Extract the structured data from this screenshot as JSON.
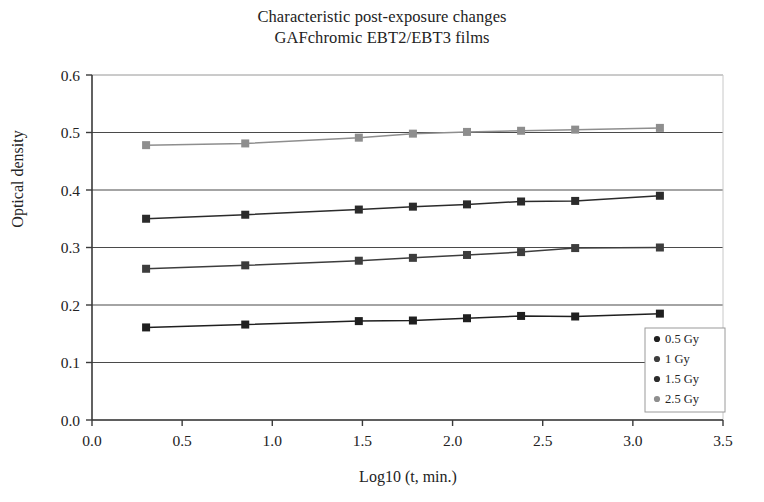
{
  "chart_data": {
    "type": "line",
    "title": "Characteristic post-exposure changes GAFchromic EBT2/EBT3 films",
    "title_lines": [
      "Characteristic post-exposure changes",
      "GAFchromic EBT2/EBT3 films"
    ],
    "xlabel": "Log10 (t, min.)",
    "ylabel": "Optical density",
    "xlim": [
      0.0,
      3.5
    ],
    "ylim": [
      0.0,
      0.6
    ],
    "xticks": [
      "0.0",
      "0.5",
      "1.0",
      "1.5",
      "2.0",
      "2.5",
      "3.0",
      "3.5"
    ],
    "xtick_values": [
      0.0,
      0.5,
      1.0,
      1.5,
      2.0,
      2.5,
      3.0,
      3.5
    ],
    "yticks": [
      "0.0",
      "0.1",
      "0.2",
      "0.3",
      "0.4",
      "0.5",
      "0.6"
    ],
    "ytick_values": [
      0.0,
      0.1,
      0.2,
      0.3,
      0.4,
      0.5,
      0.6
    ],
    "grid": "horizontal",
    "legend_position": "bottom-right",
    "x": [
      0.3,
      0.85,
      1.48,
      1.78,
      2.08,
      2.38,
      2.68,
      3.15
    ],
    "series": [
      {
        "name": "0.5 Gy",
        "color": "#1f1f1f",
        "marker": "square",
        "values": [
          0.161,
          0.166,
          0.172,
          0.173,
          0.177,
          0.181,
          0.18,
          0.185
        ]
      },
      {
        "name": "1 Gy",
        "color": "#3d3d3d",
        "marker": "square",
        "values": [
          0.263,
          0.269,
          0.277,
          0.282,
          0.287,
          0.292,
          0.299,
          0.3
        ]
      },
      {
        "name": "1.5 Gy",
        "color": "#2b2b2b",
        "marker": "square",
        "values": [
          0.35,
          0.357,
          0.366,
          0.371,
          0.375,
          0.38,
          0.381,
          0.39
        ]
      },
      {
        "name": "2.5 Gy",
        "color": "#8e8e8e",
        "marker": "square",
        "values": [
          0.478,
          0.481,
          0.491,
          0.498,
          0.501,
          0.503,
          0.505,
          0.508
        ]
      }
    ],
    "legend_entries": [
      {
        "label": "0.5 Gy",
        "color": "#1f1f1f"
      },
      {
        "label": "1 Gy",
        "color": "#3d3d3d"
      },
      {
        "label": "1.5 Gy",
        "color": "#2b2b2b"
      },
      {
        "label": "2.5 Gy",
        "color": "#8e8e8e"
      }
    ],
    "colors": {
      "axis": "#3a3a3a",
      "grid": "#4a4a4a",
      "background": "#ffffff",
      "text": "#232323"
    }
  }
}
